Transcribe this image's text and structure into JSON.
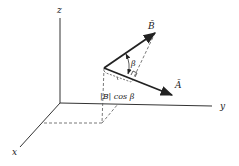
{
  "diagram": {
    "type": "vector-projection-3d",
    "axes": {
      "z": {
        "label": "z"
      },
      "y": {
        "label": "y"
      },
      "x": {
        "label": "x"
      }
    },
    "vectors": {
      "A": {
        "label": "Ā"
      },
      "B": {
        "label": "B̄"
      }
    },
    "angle": {
      "label": "β"
    },
    "projection": {
      "label": "|B| cos β"
    },
    "colors": {
      "ink": "#222222",
      "dash": "#555555",
      "background": "#ffffff"
    }
  }
}
